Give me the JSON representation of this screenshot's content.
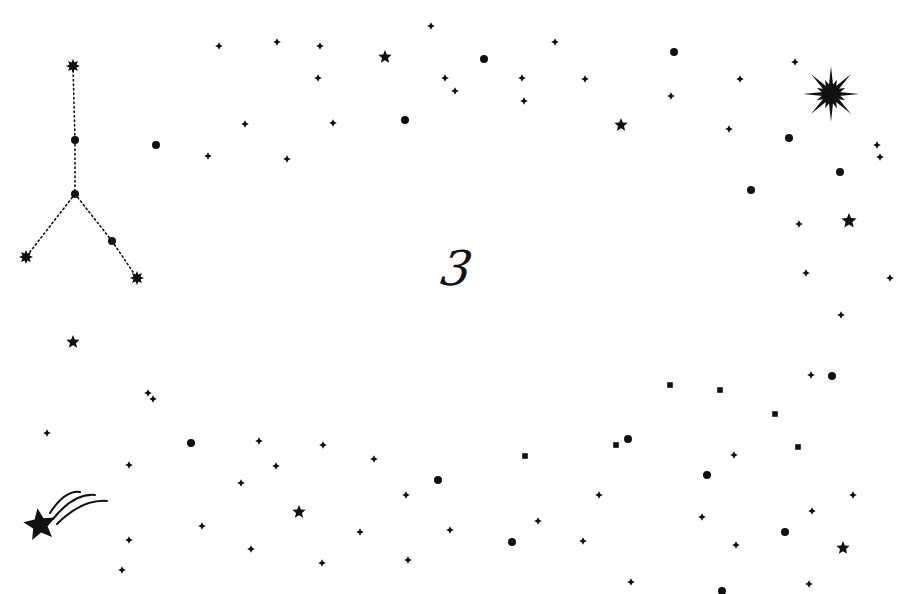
{
  "image": {
    "width": 919,
    "height": 594,
    "background": "#ffffff",
    "ink": "#111111",
    "digit": "3"
  },
  "constellation": {
    "name": "y-shaped constellation",
    "nodes": [
      {
        "x": 73,
        "y": 66,
        "shape": "burst",
        "r": 7
      },
      {
        "x": 75,
        "y": 140,
        "shape": "dot",
        "r": 4
      },
      {
        "x": 75,
        "y": 194,
        "shape": "dot",
        "r": 4
      },
      {
        "x": 26,
        "y": 257,
        "shape": "burst",
        "r": 7
      },
      {
        "x": 112,
        "y": 241,
        "shape": "dot",
        "r": 4
      },
      {
        "x": 137,
        "y": 278,
        "shape": "burst",
        "r": 7
      }
    ],
    "lines": [
      [
        0,
        1
      ],
      [
        1,
        2
      ],
      [
        2,
        3
      ],
      [
        2,
        4
      ],
      [
        4,
        5
      ]
    ]
  },
  "big_star": {
    "x": 831,
    "y": 94,
    "r": 28
  },
  "shooting_star": {
    "x": 40,
    "y": 525,
    "r": 17
  },
  "stars5": [
    {
      "x": 385,
      "y": 57,
      "r": 7
    },
    {
      "x": 621,
      "y": 125,
      "r": 7
    },
    {
      "x": 849,
      "y": 221,
      "r": 8
    },
    {
      "x": 73,
      "y": 342,
      "r": 7
    },
    {
      "x": 299,
      "y": 512,
      "r": 7
    },
    {
      "x": 843,
      "y": 548,
      "r": 7
    }
  ],
  "dots": [
    {
      "x": 156,
      "y": 145
    },
    {
      "x": 484,
      "y": 59
    },
    {
      "x": 405,
      "y": 120
    },
    {
      "x": 674,
      "y": 52
    },
    {
      "x": 789,
      "y": 138
    },
    {
      "x": 840,
      "y": 172
    },
    {
      "x": 751,
      "y": 190
    },
    {
      "x": 832,
      "y": 376
    },
    {
      "x": 191,
      "y": 443
    },
    {
      "x": 438,
      "y": 480
    },
    {
      "x": 512,
      "y": 542
    },
    {
      "x": 628,
      "y": 439
    },
    {
      "x": 707,
      "y": 475
    },
    {
      "x": 785,
      "y": 532
    },
    {
      "x": 722,
      "y": 591
    }
  ],
  "diamonds": [
    {
      "x": 219,
      "y": 46
    },
    {
      "x": 277,
      "y": 42
    },
    {
      "x": 320,
      "y": 46
    },
    {
      "x": 318,
      "y": 78
    },
    {
      "x": 431,
      "y": 26
    },
    {
      "x": 445,
      "y": 78
    },
    {
      "x": 455,
      "y": 91
    },
    {
      "x": 522,
      "y": 78
    },
    {
      "x": 524,
      "y": 101
    },
    {
      "x": 555,
      "y": 42
    },
    {
      "x": 585,
      "y": 79
    },
    {
      "x": 671,
      "y": 96
    },
    {
      "x": 740,
      "y": 79
    },
    {
      "x": 729,
      "y": 129
    },
    {
      "x": 795,
      "y": 62
    },
    {
      "x": 877,
      "y": 145
    },
    {
      "x": 880,
      "y": 157
    },
    {
      "x": 245,
      "y": 124
    },
    {
      "x": 333,
      "y": 123
    },
    {
      "x": 208,
      "y": 156
    },
    {
      "x": 287,
      "y": 159
    },
    {
      "x": 799,
      "y": 224
    },
    {
      "x": 806,
      "y": 273
    },
    {
      "x": 890,
      "y": 278
    },
    {
      "x": 841,
      "y": 315
    },
    {
      "x": 811,
      "y": 375
    },
    {
      "x": 148,
      "y": 393
    },
    {
      "x": 153,
      "y": 399
    },
    {
      "x": 47,
      "y": 433
    },
    {
      "x": 129,
      "y": 465
    },
    {
      "x": 259,
      "y": 441
    },
    {
      "x": 276,
      "y": 466
    },
    {
      "x": 323,
      "y": 445
    },
    {
      "x": 374,
      "y": 459
    },
    {
      "x": 241,
      "y": 483
    },
    {
      "x": 406,
      "y": 495
    },
    {
      "x": 202,
      "y": 526
    },
    {
      "x": 129,
      "y": 540
    },
    {
      "x": 251,
      "y": 549
    },
    {
      "x": 360,
      "y": 532
    },
    {
      "x": 322,
      "y": 563
    },
    {
      "x": 408,
      "y": 560
    },
    {
      "x": 122,
      "y": 570
    },
    {
      "x": 450,
      "y": 530
    },
    {
      "x": 599,
      "y": 495
    },
    {
      "x": 538,
      "y": 521
    },
    {
      "x": 583,
      "y": 541
    },
    {
      "x": 631,
      "y": 582
    },
    {
      "x": 734,
      "y": 455
    },
    {
      "x": 853,
      "y": 495
    },
    {
      "x": 812,
      "y": 511
    },
    {
      "x": 702,
      "y": 517
    },
    {
      "x": 736,
      "y": 545
    },
    {
      "x": 809,
      "y": 584
    }
  ],
  "squares": [
    {
      "x": 525,
      "y": 456
    },
    {
      "x": 616,
      "y": 445
    },
    {
      "x": 670,
      "y": 385
    },
    {
      "x": 720,
      "y": 390
    },
    {
      "x": 775,
      "y": 414
    },
    {
      "x": 798,
      "y": 447
    }
  ]
}
